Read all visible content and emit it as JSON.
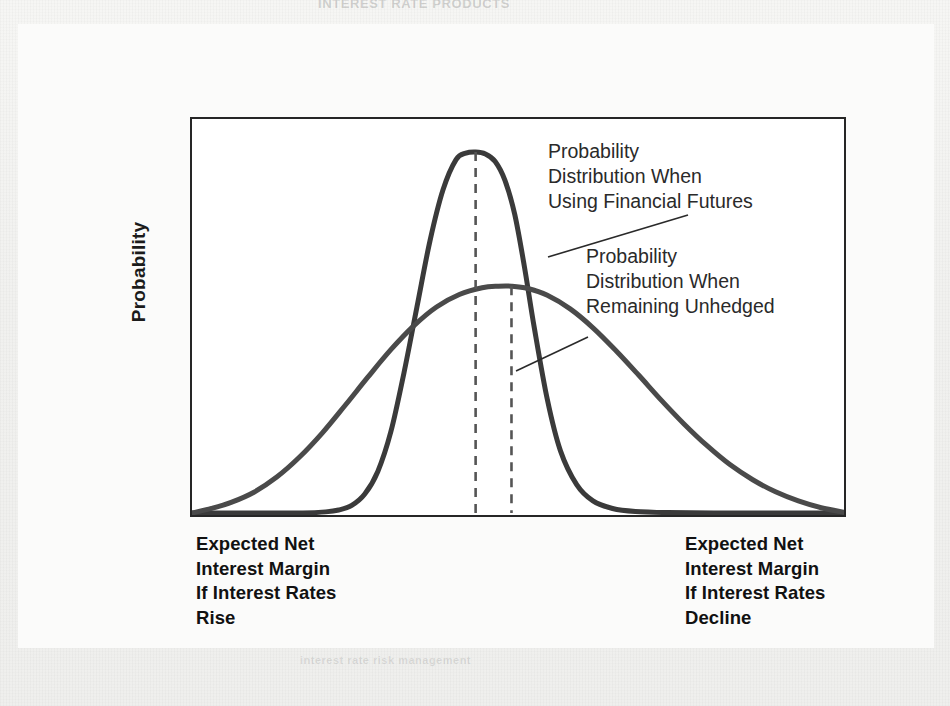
{
  "page": {
    "ghost_top_text": "INTEREST RATE PRODUCTS",
    "ghost_left_text": "est Rate Ris",
    "ghost_bottom_text": "interest rate risk management"
  },
  "chart_data": {
    "type": "line",
    "title": "",
    "subtitle": "",
    "xlabel": "Expected Net Interest Margin",
    "ylabel": "Probability",
    "grid": false,
    "legend_position": "inline-annotations",
    "axis": {
      "x_range_description": "Interest rates rise (left) to interest rates decline (right)",
      "x_tick_labels": [
        "Expected Net Interest Margin If Interest Rates Rise",
        "Expected Net Interest Margin If Interest Rates Decline"
      ],
      "y_tick_labels": [],
      "x_left_caption": "Expected Net\nInterest Margin\nIf Interest Rates\nRise",
      "x_right_caption": "Expected Net\nInterest Margin\nIf Interest Rates\nDecline"
    },
    "annotations": [
      {
        "name": "hedged-annotation",
        "text": "Probability\nDistribution When\nUsing Financial Futures",
        "points_to_series": "Probability Distribution When Using Financial Futures"
      },
      {
        "name": "unhedged-annotation",
        "text": "Probability\nDistribution When\nRemaining Unhedged",
        "points_to_series": "Probability Distribution When Remaining Unhedged"
      }
    ],
    "series": [
      {
        "name": "Probability Distribution When Using Financial Futures",
        "description": "Narrow, tall, leptokurtic distribution — low variance of net interest margin because futures hedge interest rate risk",
        "color": "#3a3a3a",
        "line_width": 5,
        "peak_x": 0.435,
        "peak_y": 0.955,
        "std_dev_relative": 0.055,
        "mean_marker": "dashed-vertical-line",
        "x": [
          0.0,
          0.06,
          0.12,
          0.17,
          0.205,
          0.225,
          0.245,
          0.265,
          0.285,
          0.305,
          0.325,
          0.345,
          0.365,
          0.385,
          0.405,
          0.42,
          0.435,
          0.45,
          0.465,
          0.48,
          0.495,
          0.51,
          0.525,
          0.545,
          0.565,
          0.59,
          0.615,
          0.645,
          0.68,
          0.73,
          0.8,
          0.88,
          1.0
        ],
        "y": [
          0.0,
          0.0,
          0.0,
          0.0,
          0.003,
          0.008,
          0.02,
          0.05,
          0.11,
          0.215,
          0.37,
          0.545,
          0.72,
          0.855,
          0.935,
          0.952,
          0.955,
          0.95,
          0.93,
          0.88,
          0.79,
          0.65,
          0.49,
          0.3,
          0.165,
          0.075,
          0.032,
          0.012,
          0.004,
          0.001,
          0.0,
          0.0,
          0.0
        ]
      },
      {
        "name": "Probability Distribution When Remaining Unhedged",
        "description": "Wide, flat, platykurtic distribution — high variance of net interest margin with no hedge",
        "color": "#4a4a4a",
        "line_width": 5,
        "peak_x": 0.49,
        "peak_y": 0.6,
        "std_dev_relative": 0.185,
        "mean_marker": "dashed-vertical-line",
        "x": [
          0.0,
          0.03,
          0.06,
          0.095,
          0.13,
          0.165,
          0.2,
          0.235,
          0.27,
          0.305,
          0.34,
          0.375,
          0.41,
          0.445,
          0.47,
          0.49,
          0.515,
          0.545,
          0.58,
          0.615,
          0.65,
          0.685,
          0.72,
          0.755,
          0.79,
          0.825,
          0.86,
          0.895,
          0.93,
          0.965,
          1.0
        ],
        "y": [
          0.0,
          0.012,
          0.028,
          0.055,
          0.095,
          0.148,
          0.212,
          0.285,
          0.36,
          0.432,
          0.495,
          0.545,
          0.578,
          0.596,
          0.6,
          0.6,
          0.594,
          0.576,
          0.54,
          0.49,
          0.43,
          0.365,
          0.298,
          0.235,
          0.178,
          0.128,
          0.088,
          0.056,
          0.032,
          0.014,
          0.002
        ]
      }
    ],
    "reference_lines": [
      {
        "name": "hedged-mean-line",
        "orientation": "vertical",
        "x": 0.435,
        "style": "dashed",
        "color": "#555555"
      },
      {
        "name": "unhedged-mean-line",
        "orientation": "vertical",
        "x": 0.49,
        "style": "dashed",
        "color": "#555555"
      }
    ],
    "colors": {
      "curve": "#3a3a3a",
      "frame": "#262626",
      "dashed_line": "#555555",
      "text": "#111111",
      "plot_background": "#ffffff",
      "page_background": "#f1f1ef"
    }
  }
}
